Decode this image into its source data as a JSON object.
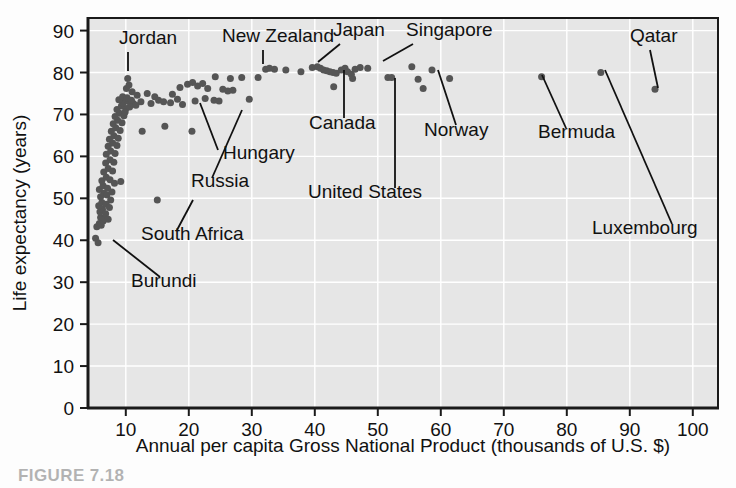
{
  "figure": {
    "caption": "FIGURE 7.18",
    "background_color": "#fdfdfd",
    "plot_background_color": "#e6e6e6",
    "gridline_color": "#ffffff",
    "axis_color": "#1a1a1a",
    "point_color": "#555555",
    "label_color": "#111111"
  },
  "chart_data": {
    "type": "scatter",
    "title": "",
    "xlabel": "Annual per capita Gross National Product (thousands of U.S. $)",
    "ylabel": "Life expectancy (years)",
    "xlim": [
      4,
      104
    ],
    "ylim": [
      0,
      93
    ],
    "xticks": [
      10,
      20,
      30,
      40,
      50,
      60,
      70,
      80,
      90,
      100
    ],
    "yticks": [
      0,
      10,
      20,
      30,
      40,
      50,
      60,
      70,
      80,
      90
    ],
    "xticklabels": [
      "10",
      "20",
      "30",
      "40",
      "50",
      "60",
      "70",
      "80",
      "90",
      "100"
    ],
    "yticklabels": [
      "0",
      "10",
      "20",
      "30",
      "40",
      "50",
      "60",
      "70",
      "80",
      "90"
    ],
    "grid": true,
    "legend": "none",
    "marker": "filled-circle",
    "marker_size": 7,
    "points": [
      [
        5.2,
        40.5
      ],
      [
        5.6,
        39.4
      ],
      [
        5.4,
        43.2
      ],
      [
        5.8,
        44.0
      ],
      [
        6.1,
        43.6
      ],
      [
        6.4,
        44.6
      ],
      [
        6.0,
        45.4
      ],
      [
        6.6,
        45.1
      ],
      [
        5.9,
        46.8
      ],
      [
        6.3,
        47.4
      ],
      [
        6.8,
        46.3
      ],
      [
        7.2,
        45.0
      ],
      [
        5.7,
        48.2
      ],
      [
        6.2,
        49.0
      ],
      [
        6.9,
        48.6
      ],
      [
        7.4,
        47.8
      ],
      [
        6.0,
        50.4
      ],
      [
        6.5,
        51.2
      ],
      [
        7.0,
        50.8
      ],
      [
        7.6,
        49.6
      ],
      [
        5.8,
        52.1
      ],
      [
        6.4,
        53.0
      ],
      [
        7.1,
        52.4
      ],
      [
        7.8,
        51.5
      ],
      [
        6.2,
        54.2
      ],
      [
        6.9,
        55.0
      ],
      [
        7.5,
        54.4
      ],
      [
        8.2,
        53.6
      ],
      [
        6.5,
        56.3
      ],
      [
        7.2,
        57.1
      ],
      [
        7.9,
        56.5
      ],
      [
        6.8,
        58.4
      ],
      [
        7.5,
        59.2
      ],
      [
        8.1,
        58.6
      ],
      [
        6.9,
        60.5
      ],
      [
        7.6,
        61.3
      ],
      [
        8.3,
        60.7
      ],
      [
        7.2,
        62.4
      ],
      [
        7.9,
        63.2
      ],
      [
        8.6,
        62.6
      ],
      [
        7.4,
        64.1
      ],
      [
        8.1,
        64.9
      ],
      [
        8.8,
        64.3
      ],
      [
        7.7,
        66.0
      ],
      [
        8.4,
        66.8
      ],
      [
        9.1,
        66.2
      ],
      [
        8.0,
        67.8
      ],
      [
        8.7,
        68.6
      ],
      [
        9.4,
        68.0
      ],
      [
        8.3,
        69.5
      ],
      [
        9.0,
        70.3
      ],
      [
        9.7,
        69.7
      ],
      [
        8.6,
        71.2
      ],
      [
        9.3,
        72.0
      ],
      [
        10.0,
        71.4
      ],
      [
        9.6,
        72.8
      ],
      [
        10.3,
        73.2
      ],
      [
        9.9,
        70.6
      ],
      [
        10.6,
        71.8
      ],
      [
        11.2,
        72.6
      ],
      [
        8.9,
        73.5
      ],
      [
        9.5,
        74.2
      ],
      [
        10.2,
        74.0
      ],
      [
        10.9,
        73.4
      ],
      [
        11.6,
        72.2
      ],
      [
        10.1,
        76.2
      ],
      [
        10.5,
        77.0
      ],
      [
        11.0,
        75.4
      ],
      [
        11.8,
        74.6
      ],
      [
        12.4,
        73.0
      ],
      [
        10.3,
        78.6
      ],
      [
        9.2,
        54.0
      ],
      [
        15.0,
        49.6
      ],
      [
        12.6,
        66.0
      ],
      [
        16.2,
        67.2
      ],
      [
        20.5,
        66.0
      ],
      [
        14.0,
        72.6
      ],
      [
        15.2,
        73.4
      ],
      [
        16.0,
        73.0
      ],
      [
        17.1,
        72.8
      ],
      [
        18.2,
        73.6
      ],
      [
        19.0,
        72.4
      ],
      [
        13.4,
        75.0
      ],
      [
        14.6,
        74.2
      ],
      [
        17.4,
        74.8
      ],
      [
        18.6,
        76.4
      ],
      [
        19.8,
        77.2
      ],
      [
        20.6,
        77.6
      ],
      [
        21.4,
        76.8
      ],
      [
        22.2,
        77.4
      ],
      [
        23.0,
        76.2
      ],
      [
        21.0,
        73.2
      ],
      [
        22.6,
        73.8
      ],
      [
        24.0,
        73.4
      ],
      [
        24.8,
        73.2
      ],
      [
        25.4,
        76.0
      ],
      [
        26.2,
        75.6
      ],
      [
        27.0,
        75.8
      ],
      [
        24.2,
        79.0
      ],
      [
        26.6,
        78.6
      ],
      [
        28.4,
        78.8
      ],
      [
        29.6,
        73.6
      ],
      [
        31.0,
        78.8
      ],
      [
        32.2,
        80.8
      ],
      [
        32.8,
        81.0
      ],
      [
        33.6,
        80.8
      ],
      [
        35.4,
        80.6
      ],
      [
        37.8,
        80.2
      ],
      [
        39.6,
        81.2
      ],
      [
        40.4,
        81.4
      ],
      [
        40.9,
        81.0
      ],
      [
        41.4,
        80.6
      ],
      [
        41.9,
        80.4
      ],
      [
        42.4,
        80.2
      ],
      [
        42.9,
        80.0
      ],
      [
        43.4,
        79.8
      ],
      [
        43.0,
        76.6
      ],
      [
        44.2,
        80.6
      ],
      [
        44.8,
        81.0
      ],
      [
        45.2,
        80.2
      ],
      [
        45.8,
        79.6
      ],
      [
        46.4,
        80.8
      ],
      [
        46.0,
        78.6
      ],
      [
        47.2,
        81.2
      ],
      [
        48.4,
        81.0
      ],
      [
        51.6,
        78.8
      ],
      [
        52.2,
        78.8
      ],
      [
        55.4,
        81.4
      ],
      [
        56.4,
        78.4
      ],
      [
        57.2,
        76.2
      ],
      [
        58.6,
        80.6
      ],
      [
        61.4,
        78.6
      ],
      [
        76.0,
        79.0
      ],
      [
        85.4,
        80.0
      ],
      [
        94.0,
        76.0
      ]
    ],
    "annotations": [
      {
        "name": "Jordan",
        "text_x": 119,
        "text_y": 44,
        "anchor": "start",
        "line": [
          [
            128,
            52
          ],
          [
            128,
            71
          ]
        ],
        "point": [
          128,
          71
        ]
      },
      {
        "name": "New Zealand",
        "text_x": 222,
        "text_y": 42,
        "anchor": "start",
        "line": [
          [
            263,
            50
          ],
          [
            263,
            64
          ]
        ],
        "point": [
          263,
          64
        ]
      },
      {
        "name": "Japan",
        "text_x": 333,
        "text_y": 36,
        "anchor": "start",
        "line": [
          [
            340,
            44
          ],
          [
            318,
            62
          ]
        ],
        "point": [
          318,
          62
        ]
      },
      {
        "name": "Singapore",
        "text_x": 406,
        "text_y": 36,
        "anchor": "start",
        "line": [
          [
            413,
            44
          ],
          [
            383,
            61
          ]
        ],
        "point": [
          383,
          61
        ]
      },
      {
        "name": "Qatar",
        "text_x": 630,
        "text_y": 42,
        "anchor": "start",
        "line": [
          [
            650,
            50
          ],
          [
            658,
            88
          ]
        ],
        "point": [
          658,
          88
        ]
      },
      {
        "name": "Canada",
        "text_x": 309,
        "text_y": 129,
        "anchor": "start",
        "line": [
          [
            344,
            118
          ],
          [
            344,
            70
          ]
        ],
        "point": [
          344,
          70
        ]
      },
      {
        "name": "Norway",
        "text_x": 424,
        "text_y": 136,
        "anchor": "start",
        "line": [
          [
            456,
            125
          ],
          [
            438,
            70
          ]
        ],
        "point": [
          438,
          70
        ]
      },
      {
        "name": "Hungary",
        "text_x": 223,
        "text_y": 159,
        "anchor": "start",
        "line": [
          [
            218,
            150
          ],
          [
            200,
            103
          ]
        ],
        "point": [
          200,
          103
        ]
      },
      {
        "name": "Russia",
        "text_x": 191,
        "text_y": 187,
        "anchor": "start",
        "line": [
          [
            212,
            178
          ],
          [
            242,
            110
          ]
        ],
        "point": [
          242,
          110
        ]
      },
      {
        "name": "United States",
        "text_x": 308,
        "text_y": 198,
        "anchor": "start",
        "line": [
          [
            395,
            188
          ],
          [
            395,
            78
          ]
        ],
        "point": [
          395,
          78
        ]
      },
      {
        "name": "South Africa",
        "text_x": 141,
        "text_y": 240,
        "anchor": "start",
        "line": [
          [
            177,
            230
          ],
          [
            193,
            200
          ]
        ],
        "point": [
          193,
          200
        ]
      },
      {
        "name": "Burundi",
        "text_x": 131,
        "text_y": 287,
        "anchor": "start",
        "line": [
          [
            160,
            277
          ],
          [
            113,
            240
          ]
        ],
        "point": [
          113,
          240
        ]
      },
      {
        "name": "Bermuda",
        "text_x": 538,
        "text_y": 138,
        "anchor": "start",
        "line": [
          [
            566,
            128
          ],
          [
            542,
            75
          ]
        ],
        "point": [
          542,
          75
        ]
      },
      {
        "name": "Luxembourg",
        "text_x": 592,
        "text_y": 234,
        "anchor": "start",
        "line": [
          [
            672,
            224
          ],
          [
            605,
            70
          ]
        ],
        "point": [
          605,
          70
        ]
      }
    ]
  }
}
